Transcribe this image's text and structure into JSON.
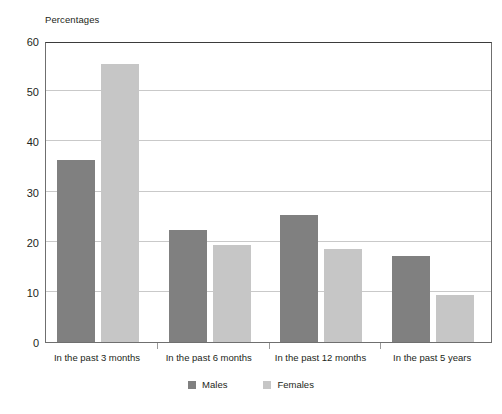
{
  "chart_data": {
    "type": "bar",
    "title": "",
    "subtitle": "",
    "ylabel": "Percentages",
    "xlabel": "",
    "ylim": [
      0,
      60
    ],
    "ytick_step": 10,
    "yticks": [
      60,
      50,
      40,
      30,
      20,
      10,
      0
    ],
    "grid": true,
    "legend_position": "bottom-center",
    "categories": [
      "In the past 3 months",
      "In the past 6 months",
      "In the past 12 months",
      "In the past 5 years"
    ],
    "series": [
      {
        "name": "Males",
        "color": "#808080",
        "values": [
          36.3,
          22.3,
          25.4,
          17.2
        ]
      },
      {
        "name": "Females",
        "color": "#c6c6c6",
        "values": [
          55.5,
          19.4,
          18.5,
          9.4
        ]
      }
    ]
  },
  "legend": {
    "items": [
      {
        "label": "Males",
        "color": "#808080"
      },
      {
        "label": "Females",
        "color": "#c6c6c6"
      }
    ]
  },
  "footnote": {
    "text": ""
  }
}
